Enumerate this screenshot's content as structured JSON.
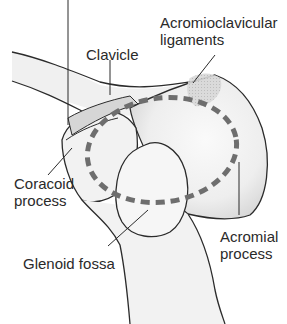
{
  "diagram": {
    "title_fragment": "",
    "colors": {
      "outline": "#2b2b2b",
      "bone_fill": "#f3f3f3",
      "bone_shade": "#dcdcdc",
      "ligament_fill": "#d2d2d2",
      "dashed_circle": "#6e6e6e",
      "text": "#2a2a2a"
    },
    "labels": {
      "clavicle": "Clavicle",
      "ac_ligaments_line1": "Acromioclavicular",
      "ac_ligaments_line2": "ligaments",
      "coracoid_line1": "Coracoid",
      "coracoid_line2": "process",
      "glenoid": "Glenoid fossa",
      "acromial_line1": "Acromial",
      "acromial_line2": "process"
    }
  }
}
